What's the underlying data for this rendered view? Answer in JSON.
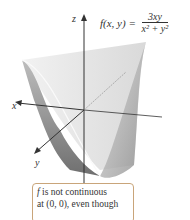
{
  "figure": {
    "formula": {
      "lhs": "f(x, y) =",
      "numerator": "3xy",
      "denominator": "x² + y²"
    },
    "axes": {
      "z": "z",
      "x": "x",
      "y": "y"
    },
    "callout": {
      "f": "f",
      "line1_rest": " is not continuous",
      "line2": "at (0, 0), even though"
    },
    "colors": {
      "surface_light": "#e4e4e4",
      "surface_dark": "#777777",
      "axis": "#333333",
      "callout_border": "#c9a57a"
    }
  }
}
